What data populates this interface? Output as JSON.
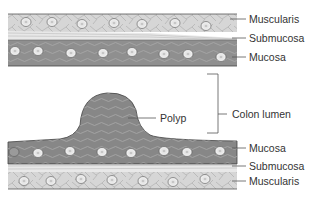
{
  "diagram": {
    "type": "anatomical cross-section",
    "colors": {
      "muscularis": "#d4d4d4",
      "submucosa": "#e6e6e6",
      "mucosa": "#8c8c8c",
      "polyp": "#7f7f7f",
      "line": "#444444"
    }
  },
  "labels": {
    "top": {
      "muscularis": "Muscularis",
      "submucosa": "Submucosa",
      "mucosa": "Mucosa"
    },
    "middle": {
      "polyp": "Polyp",
      "lumen": "Colon lumen"
    },
    "bottom": {
      "mucosa": "Mucosa",
      "submucosa": "Submucosa",
      "muscularis": "Muscularis"
    }
  }
}
